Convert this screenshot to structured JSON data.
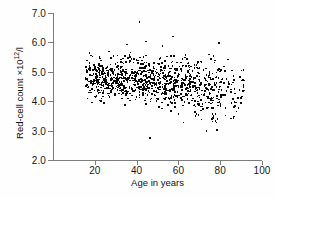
{
  "chart_data": {
    "type": "scatter",
    "title": "",
    "xlabel": "Age in years",
    "ylabel": "Red-cell count ×10¹²/l",
    "ylabel_base": "Red-cell count ×10",
    "ylabel_exponent": "12",
    "ylabel_unit": "/l",
    "xlim": [
      0,
      100
    ],
    "ylim": [
      2.0,
      7.0
    ],
    "xticks": [
      20,
      40,
      60,
      80,
      100
    ],
    "xtick_labels": [
      "20",
      "40",
      "60",
      "80",
      "100"
    ],
    "yticks": [
      2.0,
      3.0,
      4.0,
      5.0,
      6.0,
      7.0
    ],
    "ytick_labels": [
      "2.0",
      "3.0",
      "4.0",
      "5.0",
      "6.0",
      "7.0"
    ],
    "grid": false,
    "legend": null,
    "marker": "square",
    "marker_color": "#0a0a0a",
    "marker_size_px": 1.6,
    "n_points": 1040,
    "x_data_range": [
      15,
      91
    ],
    "y_data_range": [
      2.78,
      6.72
    ],
    "trend": {
      "age": [
        15,
        20,
        25,
        30,
        35,
        40,
        45,
        50,
        55,
        60,
        65,
        70,
        75,
        80,
        85
      ],
      "mean_count": [
        4.8,
        4.82,
        4.83,
        4.82,
        4.8,
        4.78,
        4.74,
        4.7,
        4.66,
        4.62,
        4.58,
        4.54,
        4.5,
        4.46,
        4.42
      ],
      "spread_sd": [
        0.34,
        0.34,
        0.35,
        0.35,
        0.36,
        0.37,
        0.38,
        0.39,
        0.4,
        0.42,
        0.43,
        0.45,
        0.47,
        0.49,
        0.5
      ]
    },
    "density_by_decade": {
      "15-19": 58,
      "20-29": 168,
      "30-39": 172,
      "40-49": 168,
      "50-59": 155,
      "60-69": 142,
      "70-79": 122,
      "80-91": 55
    },
    "notable_outliers": [
      {
        "age": 41,
        "count": 6.72
      },
      {
        "age": 57,
        "count": 6.22
      },
      {
        "age": 44,
        "count": 6.05
      },
      {
        "age": 79,
        "count": 6.01
      },
      {
        "age": 35,
        "count": 5.95
      },
      {
        "age": 52,
        "count": 5.9
      },
      {
        "age": 46,
        "count": 2.78
      },
      {
        "age": 73,
        "count": 3.02
      },
      {
        "age": 78,
        "count": 3.05
      },
      {
        "age": 62,
        "count": 3.3
      },
      {
        "age": 86,
        "count": 3.45
      },
      {
        "age": 90,
        "count": 4.18
      }
    ]
  }
}
